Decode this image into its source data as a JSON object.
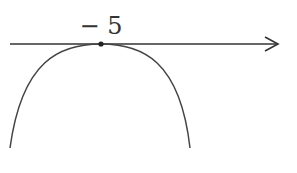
{
  "diagram": {
    "axis": {
      "direction": "right-arrow",
      "color": "#333333"
    },
    "vertex_label": "− 5",
    "vertex_value": -5,
    "curve": {
      "shape": "parabola-opening-down",
      "color": "#444444"
    }
  }
}
